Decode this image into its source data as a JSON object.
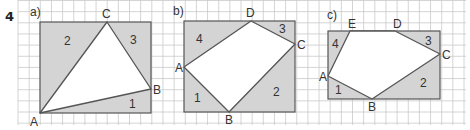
{
  "question_number": "4",
  "colors": {
    "grid": "#c9c9c9",
    "shade": "#d4d4d4",
    "outline": "#555555",
    "text": "#333333"
  },
  "grid": {
    "x0": 18,
    "y0": 0,
    "x1": 466,
    "y1": 125,
    "cell": 11.15
  },
  "panels": [
    {
      "id": "a",
      "label": "a)",
      "label_pos": [
        30,
        16
      ],
      "rect": {
        "x": 40,
        "y": 22,
        "w": 111,
        "h": 91
      },
      "vertices": [
        {
          "name": "A",
          "x": 40,
          "y": 113,
          "lx": 30,
          "ly": 126
        },
        {
          "name": "B",
          "x": 151,
          "y": 89,
          "lx": 153,
          "ly": 94
        },
        {
          "name": "C",
          "x": 107,
          "y": 22,
          "lx": 102,
          "ly": 18
        }
      ],
      "polygon": [
        "A",
        "B",
        "C"
      ],
      "regions": [
        {
          "label": "2",
          "x": 64,
          "y": 45
        },
        {
          "label": "3",
          "x": 130,
          "y": 44
        },
        {
          "label": "1",
          "x": 129,
          "y": 108
        }
      ]
    },
    {
      "id": "b",
      "label": "b)",
      "label_pos": [
        173,
        15
      ],
      "rect": {
        "x": 184,
        "y": 21,
        "w": 111,
        "h": 91
      },
      "vertices": [
        {
          "name": "A",
          "x": 184,
          "y": 67,
          "lx": 175,
          "ly": 72
        },
        {
          "name": "B",
          "x": 229,
          "y": 112,
          "lx": 225,
          "ly": 124
        },
        {
          "name": "C",
          "x": 295,
          "y": 44,
          "lx": 297,
          "ly": 49
        },
        {
          "name": "D",
          "x": 251,
          "y": 21,
          "lx": 246,
          "ly": 17
        }
      ],
      "polygon": [
        "A",
        "B",
        "C",
        "D"
      ],
      "regions": [
        {
          "label": "4",
          "x": 196,
          "y": 43
        },
        {
          "label": "3",
          "x": 279,
          "y": 33
        },
        {
          "label": "2",
          "x": 273,
          "y": 96
        },
        {
          "label": "1",
          "x": 194,
          "y": 102
        }
      ]
    },
    {
      "id": "c",
      "label": "c)",
      "label_pos": [
        327,
        19
      ],
      "rect": {
        "x": 328,
        "y": 31,
        "w": 112,
        "h": 68
      },
      "vertices": [
        {
          "name": "A",
          "x": 328,
          "y": 76,
          "lx": 319,
          "ly": 81
        },
        {
          "name": "B",
          "x": 372,
          "y": 99,
          "lx": 368,
          "ly": 111
        },
        {
          "name": "C",
          "x": 440,
          "y": 54,
          "lx": 442,
          "ly": 59
        },
        {
          "name": "D",
          "x": 395,
          "y": 31,
          "lx": 393,
          "ly": 28
        },
        {
          "name": "E",
          "x": 350,
          "y": 31,
          "lx": 348,
          "ly": 28
        }
      ],
      "polygon": [
        "A",
        "B",
        "C",
        "D",
        "E"
      ],
      "regions": [
        {
          "label": "4",
          "x": 332,
          "y": 48
        },
        {
          "label": "3",
          "x": 425,
          "y": 45
        },
        {
          "label": "2",
          "x": 420,
          "y": 87
        },
        {
          "label": "1",
          "x": 335,
          "y": 94
        }
      ]
    }
  ]
}
